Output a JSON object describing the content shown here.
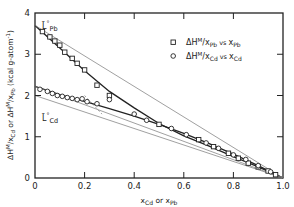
{
  "chart_data": {
    "type": "scatter",
    "title": "",
    "xlabel": "x_Cd or x_Pb",
    "ylabel": "ΔH^M/x_Cd or ΔH^M/x_Pb (kcal g-atom^-1)",
    "xlim": [
      0,
      1.0
    ],
    "ylim": [
      0,
      4
    ],
    "x_ticks": [
      "0",
      "0.2",
      "0.4",
      "0.6",
      "0.8",
      "1.0"
    ],
    "y_ticks": [
      "0",
      "1",
      "2",
      "3",
      "4"
    ],
    "grid": false,
    "legend_position": "upper right",
    "annotations": [
      {
        "text": "L̄°Pb",
        "x": 0.02,
        "y": 3.85
      },
      {
        "text": "L̄°Cd",
        "x": 0.02,
        "y": 1.55
      }
    ],
    "series": [
      {
        "name": "ΔH^M/x_Pb vs x_Pb",
        "marker": "square",
        "points": [
          [
            0.03,
            3.55
          ],
          [
            0.06,
            3.42
          ],
          [
            0.08,
            3.32
          ],
          [
            0.1,
            3.22
          ],
          [
            0.12,
            3.05
          ],
          [
            0.15,
            2.9
          ],
          [
            0.17,
            2.78
          ],
          [
            0.2,
            2.62
          ],
          [
            0.25,
            2.25
          ],
          [
            0.3,
            2.0
          ],
          [
            0.5,
            1.3
          ],
          [
            0.66,
            0.93
          ],
          [
            0.72,
            0.76
          ],
          [
            0.78,
            0.6
          ],
          [
            0.82,
            0.48
          ],
          [
            0.86,
            0.36
          ],
          [
            0.9,
            0.27
          ],
          [
            0.94,
            0.17
          ],
          [
            0.97,
            0.08
          ]
        ]
      },
      {
        "name": "ΔH^M/x_Cd vs x_Cd",
        "marker": "circle",
        "points": [
          [
            0.02,
            2.15
          ],
          [
            0.05,
            2.1
          ],
          [
            0.07,
            2.05
          ],
          [
            0.09,
            2.0
          ],
          [
            0.11,
            1.98
          ],
          [
            0.13,
            1.95
          ],
          [
            0.15,
            1.93
          ],
          [
            0.17,
            1.9
          ],
          [
            0.19,
            1.92
          ],
          [
            0.21,
            1.85
          ],
          [
            0.25,
            1.8
          ],
          [
            0.3,
            1.9
          ],
          [
            0.4,
            1.55
          ],
          [
            0.45,
            1.4
          ],
          [
            0.55,
            1.2
          ],
          [
            0.61,
            1.05
          ],
          [
            0.69,
            0.85
          ],
          [
            0.74,
            0.72
          ],
          [
            0.8,
            0.56
          ],
          [
            0.85,
            0.45
          ],
          [
            0.9,
            0.3
          ],
          [
            0.95,
            0.15
          ]
        ]
      }
    ],
    "lines": [
      {
        "name": "Pb fit curve",
        "points": [
          [
            0,
            3.7
          ],
          [
            0.1,
            3.15
          ],
          [
            0.2,
            2.6
          ],
          [
            0.3,
            2.1
          ],
          [
            0.4,
            1.7
          ],
          [
            0.5,
            1.32
          ],
          [
            0.6,
            1.02
          ],
          [
            0.7,
            0.78
          ],
          [
            0.8,
            0.52
          ],
          [
            0.9,
            0.27
          ],
          [
            1.0,
            0
          ]
        ]
      },
      {
        "name": "Cd fit curve",
        "points": [
          [
            0,
            2.22
          ],
          [
            0.1,
            2.02
          ],
          [
            0.2,
            1.86
          ],
          [
            0.3,
            1.68
          ],
          [
            0.4,
            1.5
          ],
          [
            0.5,
            1.3
          ],
          [
            0.6,
            1.08
          ],
          [
            0.7,
            0.84
          ],
          [
            0.8,
            0.58
          ],
          [
            0.9,
            0.3
          ],
          [
            1.0,
            0
          ]
        ]
      },
      {
        "name": "Pb tangent",
        "points": [
          [
            0,
            3.7
          ],
          [
            1.0,
            0
          ]
        ]
      },
      {
        "name": "Cd tangent",
        "points": [
          [
            0,
            2.0
          ],
          [
            1.0,
            0
          ]
        ]
      },
      {
        "name": "Cd lower line",
        "points": [
          [
            0,
            2.22
          ],
          [
            1.0,
            0
          ]
        ]
      },
      {
        "name": "dashed extension",
        "points": [
          [
            0.2,
            2.0
          ],
          [
            0.27,
            1.55
          ]
        ]
      }
    ]
  },
  "legend": [
    {
      "symbol": "□",
      "label": "ΔHᴹ/x_Pb vs x_Pb"
    },
    {
      "symbol": "○",
      "label": "ΔHᴹ/x_Cd vs x_Cd"
    }
  ],
  "colors": {
    "ink": "#222222",
    "background": "#ffffff"
  }
}
